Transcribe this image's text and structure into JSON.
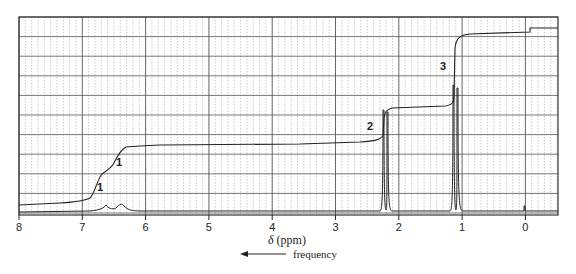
{
  "chart_data": {
    "type": "line",
    "title": "",
    "subtitle": "1H NMR spectrum with integration trace",
    "xlabel": "δ (ppm)",
    "xlabel_symbol": "δ",
    "xlabel_unit": "(ppm)",
    "ylabel": "",
    "x_reversed": true,
    "xlim": [
      8,
      -0.5
    ],
    "xticks": [
      8,
      7,
      6,
      5,
      4,
      3,
      2,
      1,
      0
    ],
    "tick_labels": [
      "8",
      "7",
      "6",
      "5",
      "4",
      "3",
      "2",
      "1",
      "0"
    ],
    "grid": true,
    "legend": null,
    "direction_annotation": "frequency",
    "peaks": [
      {
        "shift_ppm": 6.55,
        "multiplicity": "broad",
        "relative_height": 0.08
      },
      {
        "shift_ppm": 6.25,
        "multiplicity": "broad",
        "relative_height": 0.08
      },
      {
        "shift_ppm": 2.25,
        "multiplicity": "singlet (tall)",
        "relative_height": 0.95
      },
      {
        "shift_ppm": 1.1,
        "multiplicity": "singlet (tall)",
        "relative_height": 1.0
      },
      {
        "shift_ppm": 0.0,
        "multiplicity": "TMS reference",
        "relative_height": 0.05
      }
    ],
    "integration_labels": [
      {
        "label": "1",
        "shift_ppm": 6.7
      },
      {
        "label": "1",
        "shift_ppm": 6.4
      },
      {
        "label": "2",
        "shift_ppm": 2.4
      },
      {
        "label": "3",
        "shift_ppm": 1.25
      }
    ],
    "integration_steps": [
      {
        "region_ppm": [
          6.7,
          6.4
        ],
        "height_fraction": 0.167
      },
      {
        "region_ppm": [
          6.4,
          6.1
        ],
        "height_fraction": 0.167
      },
      {
        "region_ppm": [
          2.3,
          2.2
        ],
        "height_fraction": 0.333
      },
      {
        "region_ppm": [
          1.15,
          1.05
        ],
        "height_fraction": 0.5
      }
    ]
  },
  "labels": {
    "x_axis_title_symbol": "δ",
    "x_axis_title_unit": " (ppm)",
    "frequency": "frequency",
    "ticks": [
      "8",
      "7",
      "6",
      "5",
      "4",
      "3",
      "2",
      "1",
      "0"
    ],
    "peak_1a": "1",
    "peak_1b": "1",
    "peak_2": "2",
    "peak_3": "3"
  }
}
